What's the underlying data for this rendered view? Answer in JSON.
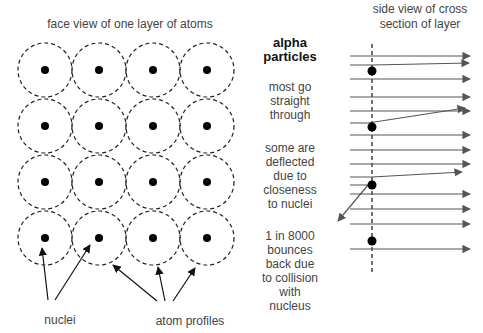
{
  "titles": {
    "face_view": "face view of one layer of atoms",
    "side_view_line1": "side view of cross",
    "side_view_line2": "section of  layer"
  },
  "labels": {
    "alpha_line1": "alpha",
    "alpha_line2": "particles",
    "most_1": "most go",
    "most_2": "straight",
    "most_3": "through",
    "some_1": "some are",
    "some_2": "deflected",
    "some_3": "due to",
    "some_4": "closeness",
    "some_5": "to nuclei",
    "one_1": "1 in 8000",
    "one_2": "bounces",
    "one_3": "back due",
    "one_4": "to collision",
    "one_5": "with",
    "one_6": "nucleus",
    "nuclei": "nuclei",
    "atom_profiles": "atom profiles"
  },
  "grid": {
    "rows": 4,
    "cols": 4,
    "x0": 45,
    "y0": 70,
    "dx": 54,
    "dy": 56,
    "atom_radius": 27,
    "nucleus_radius": 4
  },
  "colors": {
    "line": "#444444",
    "nucleus": "#000000",
    "text": "#444444"
  }
}
